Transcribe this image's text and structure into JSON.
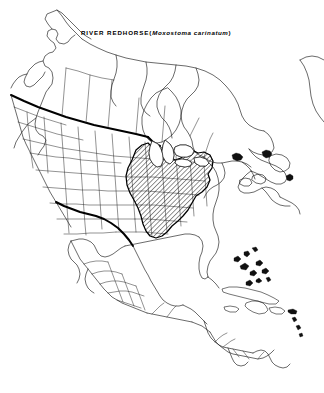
{
  "figure": {
    "kind": "species-distribution-map",
    "region": "North America",
    "title": {
      "common_name": "RIVER REDHORSE",
      "open_paren": "(",
      "scientific_name": "Moxostoma carinatum",
      "close_paren": ")",
      "full": "RIVER REDHORSE (Moxostoma carinatum)"
    },
    "colors": {
      "background": "#ffffff",
      "ink": "#000000",
      "coastline": "#1a1a1a",
      "subdivision_line": "#262626",
      "national_border": "#000000",
      "range_hatch": "#000000",
      "lake_fill": "#ffffff"
    },
    "symbology": {
      "range_style": "diagonal-hatch",
      "range_hatch_angle_deg": 45,
      "national_border_style": "heavy-solid",
      "subdivision_style": "thin-solid",
      "water_style": "white-unfilled"
    },
    "range_description": "Ohio River, Mississippi River and lower Great Lakes drainages of the central and eastern United States",
    "dimensions": {
      "width": 324,
      "height": 393
    }
  }
}
